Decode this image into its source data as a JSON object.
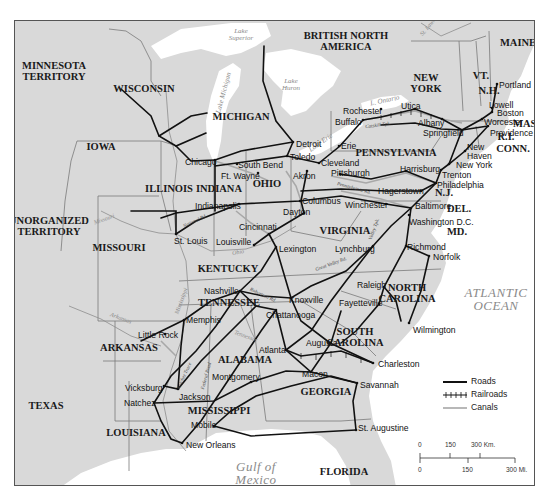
{
  "map": {
    "regions": [
      {
        "id": "minnesota-territory",
        "label": "MINNESOTA\nTERRITORY",
        "x": 53,
        "y": 70
      },
      {
        "id": "wisconsin",
        "label": "WISCONSIN",
        "x": 143,
        "y": 88
      },
      {
        "id": "michigan",
        "label": "MICHIGAN",
        "x": 240,
        "y": 116
      },
      {
        "id": "iowa",
        "label": "IOWA",
        "x": 100,
        "y": 146
      },
      {
        "id": "illinois",
        "label": "ILLINOIS",
        "x": 168,
        "y": 188
      },
      {
        "id": "indiana",
        "label": "INDIANA",
        "x": 218,
        "y": 188
      },
      {
        "id": "ohio",
        "label": "OHIO",
        "x": 266,
        "y": 183
      },
      {
        "id": "unorganized-territory",
        "label": "UNORGANIZED\nTERRITORY",
        "x": 48,
        "y": 225
      },
      {
        "id": "missouri",
        "label": "MISSOURI",
        "x": 118,
        "y": 247
      },
      {
        "id": "kentucky",
        "label": "KENTUCKY",
        "x": 227,
        "y": 268
      },
      {
        "id": "tennessee",
        "label": "TENNESSEE",
        "x": 228,
        "y": 302
      },
      {
        "id": "virginia",
        "label": "VIRGINIA",
        "x": 344,
        "y": 230
      },
      {
        "id": "british-north-america",
        "label": "BRITISH NORTH\nAMERICA",
        "x": 345,
        "y": 40
      },
      {
        "id": "new-york",
        "label": "NEW\nYORK",
        "x": 425,
        "y": 82
      },
      {
        "id": "vt",
        "label": "VT.",
        "x": 480,
        "y": 75
      },
      {
        "id": "nh",
        "label": "N.H.",
        "x": 488,
        "y": 90
      },
      {
        "id": "maine",
        "label": "MAINE",
        "x": 517,
        "y": 42
      },
      {
        "id": "mass",
        "label": "MASS.",
        "x": 528,
        "y": 123
      },
      {
        "id": "ri",
        "label": "R.I.",
        "x": 505,
        "y": 136
      },
      {
        "id": "conn",
        "label": "CONN.",
        "x": 512,
        "y": 148
      },
      {
        "id": "pennsylvania",
        "label": "PENNSYLVANIA",
        "x": 395,
        "y": 152
      },
      {
        "id": "nj",
        "label": "N.J.",
        "x": 443,
        "y": 192
      },
      {
        "id": "del",
        "label": "DEL.",
        "x": 458,
        "y": 208
      },
      {
        "id": "md",
        "label": "MD.",
        "x": 456,
        "y": 231
      },
      {
        "id": "north-carolina",
        "label": "NORTH\nCAROLINA",
        "x": 406,
        "y": 292
      },
      {
        "id": "south-carolina",
        "label": "SOUTH\nCAROLINA",
        "x": 354,
        "y": 336
      },
      {
        "id": "arkansas",
        "label": "ARKANSAS",
        "x": 128,
        "y": 347
      },
      {
        "id": "alabama",
        "label": "ALABAMA",
        "x": 244,
        "y": 359
      },
      {
        "id": "georgia",
        "label": "GEORGIA",
        "x": 325,
        "y": 391
      },
      {
        "id": "texas",
        "label": "TEXAS",
        "x": 45,
        "y": 405
      },
      {
        "id": "mississippi",
        "label": "MISSISSIPPI",
        "x": 218,
        "y": 410
      },
      {
        "id": "louisiana",
        "label": "LOUISIANA",
        "x": 135,
        "y": 432
      },
      {
        "id": "florida",
        "label": "FLORIDA",
        "x": 343,
        "y": 471
      }
    ],
    "water_bodies": [
      {
        "id": "lake-superior",
        "label": "Lake\nSuperior",
        "x": 240,
        "y": 34,
        "size": "small"
      },
      {
        "id": "lake-michigan",
        "label": "Lake Michigan",
        "x": 223,
        "y": 92,
        "size": "small",
        "rotate": -75
      },
      {
        "id": "lake-huron",
        "label": "Lake\nHuron",
        "x": 290,
        "y": 84,
        "size": "small"
      },
      {
        "id": "lake-ontario",
        "label": "L. Ontario",
        "x": 384,
        "y": 100,
        "size": "small",
        "rotate": -12
      },
      {
        "id": "lake-erie",
        "label": "Lake Erie",
        "x": 320,
        "y": 142,
        "size": "small",
        "rotate": -35
      },
      {
        "id": "atlantic-ocean",
        "label": "ATLANTIC\nOCEAN",
        "x": 495,
        "y": 298,
        "size": "big"
      },
      {
        "id": "gulf-of-mexico",
        "label": "Gulf of\nMexico",
        "x": 255,
        "y": 472,
        "size": "big"
      }
    ],
    "rivers": [
      {
        "id": "st-lawrence",
        "label": "St. Lawrence",
        "x": 430,
        "y": 22,
        "rotate": -50
      },
      {
        "id": "missouri-river",
        "label": "Missouri",
        "x": 103,
        "y": 218,
        "rotate": -20
      },
      {
        "id": "ohio-river",
        "label": "Ohio",
        "x": 237,
        "y": 251,
        "rotate": -10
      },
      {
        "id": "arkansas-river",
        "label": "Arkansas",
        "x": 120,
        "y": 317,
        "rotate": 20
      },
      {
        "id": "mississippi-river",
        "label": "Mississippi",
        "x": 180,
        "y": 300,
        "rotate": -70
      },
      {
        "id": "tennessee-river",
        "label": "Tennessee",
        "x": 245,
        "y": 335,
        "rotate": 20
      }
    ],
    "route_names": [
      {
        "id": "national-road",
        "label": "National Rd.",
        "x": 194,
        "y": 220,
        "rotate": -25
      },
      {
        "id": "natchez-trace",
        "label": "Natchez Trace",
        "x": 183,
        "y": 375,
        "rotate": -65
      },
      {
        "id": "federal-road",
        "label": "Federal Road",
        "x": 205,
        "y": 375,
        "rotate": -75
      },
      {
        "id": "catskill-tpk",
        "label": "Catskill Tpk.",
        "x": 377,
        "y": 124,
        "rotate": -8
      },
      {
        "id": "pennsylvania-road",
        "label": "Pennsylvania Rd.",
        "x": 353,
        "y": 187,
        "rotate": 15
      },
      {
        "id": "valley-tpk",
        "label": "Valley Tpk.",
        "x": 373,
        "y": 228,
        "rotate": -70
      },
      {
        "id": "great-valley-rd",
        "label": "Great Valley Rd.",
        "x": 330,
        "y": 263,
        "rotate": -20
      },
      {
        "id": "robertson-road",
        "label": "Robertson Rd.",
        "x": 262,
        "y": 294,
        "rotate": 25
      }
    ],
    "cities": [
      {
        "id": "portland",
        "label": "Portland",
        "x": 498,
        "y": 80,
        "dot": [
          496,
          83
        ]
      },
      {
        "id": "lowell",
        "label": "Lowell",
        "x": 488,
        "y": 100,
        "dot": [
          491,
          107
        ]
      },
      {
        "id": "boston",
        "label": "Boston",
        "x": 496,
        "y": 108,
        "dot": [
          491,
          111
        ]
      },
      {
        "id": "worcester",
        "label": "Worcester",
        "x": 483,
        "y": 117,
        "dot": [
          481,
          118
        ]
      },
      {
        "id": "providence",
        "label": "Providence",
        "x": 489,
        "y": 128,
        "dot": [
          487,
          125
        ]
      },
      {
        "id": "utica",
        "label": "Utica",
        "x": 400,
        "y": 101,
        "dot": [
          414,
          108
        ]
      },
      {
        "id": "rochester",
        "label": "Rochester",
        "x": 342,
        "y": 106,
        "dot": [
          380,
          108
        ]
      },
      {
        "id": "buffalo",
        "label": "Buffalo",
        "x": 334,
        "y": 117,
        "dot": [
          362,
          119
        ]
      },
      {
        "id": "albany",
        "label": "Albany",
        "x": 417,
        "y": 118,
        "dot": [
          441,
          118
        ]
      },
      {
        "id": "springfield",
        "label": "Springfield",
        "x": 422,
        "y": 128,
        "dot": [
          461,
          129
        ]
      },
      {
        "id": "new-haven",
        "label": "New\nHaven",
        "x": 466,
        "y": 142,
        "dot": [
          464,
          150
        ]
      },
      {
        "id": "new-york",
        "label": "New York",
        "x": 455,
        "y": 160,
        "dot": [
          448,
          163
        ]
      },
      {
        "id": "erie",
        "label": "Erie",
        "x": 340,
        "y": 141,
        "dot": [
          338,
          145
        ]
      },
      {
        "id": "detroit",
        "label": "Detroit",
        "x": 295,
        "y": 139,
        "dot": [
          292,
          141
        ]
      },
      {
        "id": "toledo",
        "label": "Toledo",
        "x": 289,
        "y": 152,
        "dot": [
          286,
          155
        ]
      },
      {
        "id": "chicago",
        "label": "Chicago",
        "x": 184,
        "y": 157,
        "dot": [
          214,
          159
        ]
      },
      {
        "id": "south-bend",
        "label": "South Bend",
        "x": 237,
        "y": 160,
        "dot": [
          236,
          163
        ]
      },
      {
        "id": "cleveland",
        "label": "Cleveland",
        "x": 320,
        "y": 158,
        "dot": [
          318,
          162
        ]
      },
      {
        "id": "ft-wayne",
        "label": "Ft. Wayne",
        "x": 220,
        "y": 171,
        "dot": [
          257,
          172
        ]
      },
      {
        "id": "akron",
        "label": "Akron",
        "x": 292,
        "y": 171,
        "dot": [
          306,
          170
        ]
      },
      {
        "id": "pittsburgh",
        "label": "Pittsburgh",
        "x": 330,
        "y": 168,
        "dot": [
          339,
          173
        ]
      },
      {
        "id": "harrisburg",
        "label": "Harrisburg",
        "x": 399,
        "y": 164,
        "dot": [
          405,
          170
        ]
      },
      {
        "id": "trenton",
        "label": "Trenton",
        "x": 441,
        "y": 170,
        "dot": [
          440,
          169
        ]
      },
      {
        "id": "philadelphia",
        "label": "Philadelphia",
        "x": 436,
        "y": 180,
        "dot": [
          435,
          182
        ]
      },
      {
        "id": "indianapolis",
        "label": "Indianapolis",
        "x": 194,
        "y": 201,
        "dot": [
          238,
          203
        ]
      },
      {
        "id": "columbus",
        "label": "Columbus",
        "x": 301,
        "y": 196,
        "dot": [
          299,
          200
        ]
      },
      {
        "id": "hagerstown",
        "label": "Hagerstown",
        "x": 377,
        "y": 186,
        "dot": [
          420,
          190
        ]
      },
      {
        "id": "winchester",
        "label": "Winchester",
        "x": 344,
        "y": 200,
        "dot": [
          385,
          203
        ]
      },
      {
        "id": "baltimore",
        "label": "Baltimore",
        "x": 414,
        "y": 201,
        "dot": [
          410,
          207
        ]
      },
      {
        "id": "dayton",
        "label": "Dayton",
        "x": 282,
        "y": 207,
        "dot": [
          303,
          212
        ]
      },
      {
        "id": "washington",
        "label": "Washington D.C.",
        "x": 408,
        "y": 217,
        "dot": [
          408,
          214
        ]
      },
      {
        "id": "cincinnati",
        "label": "Cincinnati",
        "x": 238,
        "y": 222,
        "dot": [
          268,
          233
        ]
      },
      {
        "id": "st-louis",
        "label": "St. Louis",
        "x": 173,
        "y": 236,
        "dot": [
          175,
          233
        ]
      },
      {
        "id": "louisville",
        "label": "Louisville",
        "x": 215,
        "y": 237,
        "dot": [
          253,
          244
        ]
      },
      {
        "id": "lexington",
        "label": "Lexington",
        "x": 278,
        "y": 244,
        "dot": [
          275,
          246
        ]
      },
      {
        "id": "lynchburg",
        "label": "Lynchburg",
        "x": 334,
        "y": 244,
        "dot": [
          372,
          245
        ]
      },
      {
        "id": "richmond",
        "label": "Richmond",
        "x": 406,
        "y": 242,
        "dot": [
          405,
          245
        ]
      },
      {
        "id": "norfolk",
        "label": "Norfolk",
        "x": 432,
        "y": 252,
        "dot": [
          428,
          255
        ]
      },
      {
        "id": "nashville",
        "label": "Nashville",
        "x": 203,
        "y": 286,
        "dot": [
          239,
          290
        ]
      },
      {
        "id": "raleigh",
        "label": "Raleigh",
        "x": 356,
        "y": 280,
        "dot": [
          383,
          286
        ]
      },
      {
        "id": "knoxville",
        "label": "Knoxville",
        "x": 288,
        "y": 295,
        "dot": [
          290,
          297
        ]
      },
      {
        "id": "fayetteville",
        "label": "Fayetteville",
        "x": 338,
        "y": 298,
        "dot": [
          378,
          303
        ]
      },
      {
        "id": "memphis",
        "label": "Memphis",
        "x": 185,
        "y": 315,
        "dot": [
          183,
          319
        ]
      },
      {
        "id": "chattanooga",
        "label": "Chattanooga",
        "x": 265,
        "y": 310,
        "dot": [
          275,
          309
        ]
      },
      {
        "id": "wilmington",
        "label": "Wilmington",
        "x": 412,
        "y": 325,
        "dot": [
          408,
          322
        ]
      },
      {
        "id": "little-rock",
        "label": "Little Rock",
        "x": 137,
        "y": 330,
        "dot": [
          164,
          333
        ]
      },
      {
        "id": "atlanta",
        "label": "Atlanta",
        "x": 258,
        "y": 345,
        "dot": [
          285,
          349
        ]
      },
      {
        "id": "augusta",
        "label": "Augusta",
        "x": 305,
        "y": 338,
        "dot": [
          329,
          342
        ]
      },
      {
        "id": "charleston",
        "label": "Charleston",
        "x": 377,
        "y": 359,
        "dot": [
          372,
          362
        ]
      },
      {
        "id": "montgomery",
        "label": "Montgomery",
        "x": 211,
        "y": 372,
        "dot": [
          250,
          381
        ]
      },
      {
        "id": "macon",
        "label": "Macon",
        "x": 301,
        "y": 369,
        "dot": [
          310,
          371
        ]
      },
      {
        "id": "savannah",
        "label": "Savannah",
        "x": 359,
        "y": 380,
        "dot": [
          356,
          382
        ]
      },
      {
        "id": "vicksburg",
        "label": "Vicksburg",
        "x": 124,
        "y": 383,
        "dot": [
          163,
          385
        ]
      },
      {
        "id": "jackson",
        "label": "Jackson",
        "x": 178,
        "y": 392,
        "dot": [
          177,
          388
        ]
      },
      {
        "id": "natchez",
        "label": "Natchez",
        "x": 123,
        "y": 398,
        "dot": [
          153,
          402
        ]
      },
      {
        "id": "mobile",
        "label": "Mobile",
        "x": 190,
        "y": 420,
        "dot": [
          213,
          425
        ]
      },
      {
        "id": "st-augustine",
        "label": "St. Augustine",
        "x": 357,
        "y": 423,
        "dot": [
          355,
          429
        ]
      },
      {
        "id": "new-orleans",
        "label": "New Orleans",
        "x": 185,
        "y": 440,
        "dot": [
          181,
          442
        ]
      }
    ]
  },
  "legend": {
    "items": [
      {
        "id": "roads",
        "label": "Roads"
      },
      {
        "id": "railroads",
        "label": "Railroads"
      },
      {
        "id": "canals",
        "label": "Canals"
      }
    ]
  },
  "scale": {
    "km": {
      "labels": [
        "0",
        "150",
        "300 Km."
      ]
    },
    "mi": {
      "labels": [
        "0",
        "150",
        "300 Mi."
      ]
    }
  },
  "colors": {
    "land": "#d9d9d9",
    "water": "#ffffff",
    "roads": "#111111",
    "canals": "#a8a8a8",
    "borders": "#7a7a7a",
    "frame": "#555555"
  }
}
